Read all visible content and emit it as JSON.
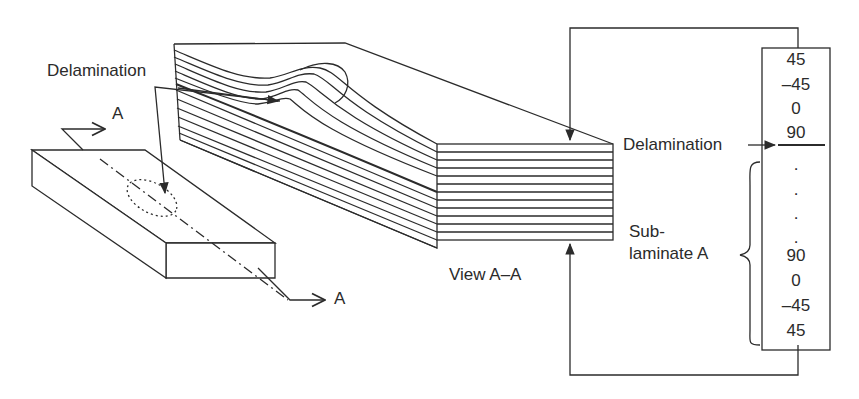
{
  "diagram": {
    "labels": {
      "delamination_left": "Delamination",
      "section_a_top": "A",
      "section_a_bottom": "A",
      "view_label": "View A–A",
      "delamination_right": "Delamination",
      "sublaminate_line1": "Sub-",
      "sublaminate_line2": "laminate A"
    },
    "ply_stack": {
      "top": [
        "45",
        "–45",
        "0",
        "90"
      ],
      "dots": [
        ".",
        ".",
        ".",
        "."
      ],
      "bottom": [
        "90",
        "0",
        "–45",
        "45"
      ]
    },
    "line_color": "#2b2b2b",
    "front_face_layers": 12
  }
}
